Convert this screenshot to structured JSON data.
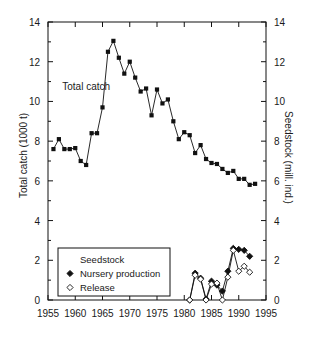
{
  "chart_data": {
    "type": "line",
    "title": "",
    "xlabel": "",
    "ylabel": "Total catch (1000 t)",
    "ylabel_right": "Seedstock (mill. ind.)",
    "xlim": [
      1955,
      1995
    ],
    "ylim": [
      0,
      14
    ],
    "ylim_right": [
      0,
      14
    ],
    "xticks": [
      1955,
      1960,
      1965,
      1970,
      1975,
      1980,
      1985,
      1990,
      1995
    ],
    "yticks": [
      0,
      2,
      4,
      6,
      8,
      10,
      12,
      14
    ],
    "yticks_right": [
      0,
      2,
      4,
      6,
      8,
      10,
      12,
      14
    ],
    "xtick_labels": [
      "1955",
      "1960",
      "1965",
      "1970",
      "1975",
      "1980",
      "1985",
      "1990",
      "1995"
    ],
    "ytick_labels": [
      "0",
      "2",
      "4",
      "6",
      "8",
      "10",
      "12",
      "14"
    ],
    "ytick_labels_right": [
      "0",
      "2",
      "4",
      "6",
      "8",
      "10",
      "12",
      "14"
    ],
    "grid": false,
    "annotations": [
      {
        "text": "Total catch",
        "x": 1962.0,
        "y": 10.6
      }
    ],
    "legend": {
      "position": "bottom-left",
      "title": "Seedstock",
      "entries": [
        {
          "label": "Nursery production",
          "marker": "filled-diamond"
        },
        {
          "label": "Release",
          "marker": "open-diamond"
        }
      ]
    },
    "series": [
      {
        "name": "Total catch",
        "axis": "left",
        "marker": "filled-square",
        "units": "1000 t",
        "x": [
          1956,
          1957,
          1958,
          1959,
          1960,
          1961,
          1962,
          1963,
          1964,
          1965,
          1966,
          1967,
          1968,
          1969,
          1970,
          1971,
          1972,
          1973,
          1974,
          1975,
          1976,
          1977,
          1978,
          1979,
          1980,
          1981,
          1982,
          1983,
          1984,
          1985,
          1986,
          1987,
          1988,
          1989,
          1990,
          1991,
          1992,
          1993
        ],
        "values": [
          7.6,
          8.1,
          7.6,
          7.6,
          7.65,
          7.0,
          6.8,
          8.4,
          8.4,
          9.7,
          12.5,
          13.05,
          12.2,
          11.4,
          12.0,
          11.2,
          10.5,
          10.65,
          9.3,
          10.6,
          9.9,
          10.1,
          9.0,
          8.1,
          8.45,
          8.3,
          7.4,
          7.8,
          7.1,
          6.9,
          6.85,
          6.6,
          6.4,
          6.5,
          6.1,
          6.1,
          5.8,
          5.85
        ]
      },
      {
        "name": "Nursery production",
        "axis": "right",
        "marker": "filled-diamond",
        "units": "mill. ind.",
        "x": [
          1981,
          1982,
          1983,
          1984,
          1985,
          1986,
          1987,
          1988,
          1989,
          1990,
          1991,
          1992
        ],
        "values": [
          0.0,
          1.35,
          1.1,
          0.05,
          0.95,
          0.75,
          0.45,
          1.45,
          2.6,
          2.55,
          2.5,
          2.2
        ]
      },
      {
        "name": "Release",
        "axis": "right",
        "marker": "open-diamond",
        "units": "mill. ind.",
        "x": [
          1981,
          1982,
          1983,
          1984,
          1985,
          1986,
          1987,
          1988,
          1989,
          1990,
          1991,
          1992
        ],
        "values": [
          0.0,
          1.25,
          1.05,
          0.0,
          0.8,
          0.85,
          0.0,
          1.15,
          2.5,
          1.45,
          1.7,
          1.4
        ]
      }
    ]
  }
}
